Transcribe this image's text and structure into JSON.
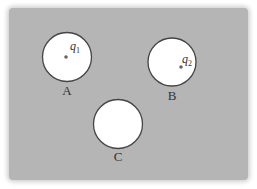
{
  "diagram": {
    "type": "conductor-with-cavities",
    "background_color": "#ffffff",
    "conductor": {
      "color": "#b5b5b5",
      "x": 9,
      "y": 8,
      "width": 239,
      "height": 172
    },
    "cavity_fill": "#ffffff",
    "cavity_stroke": "#444444",
    "charge_color": "#666666",
    "cavities": [
      {
        "label": "A",
        "cx": 67,
        "cy": 57,
        "r": 24.5,
        "label_x": 67,
        "label_y": 95,
        "charge": {
          "symbol": "q",
          "subscript": "1",
          "x": 66,
          "y": 57,
          "text_x": 70,
          "text_y": 50
        }
      },
      {
        "label": "B",
        "cx": 172,
        "cy": 62,
        "r": 24,
        "label_x": 172,
        "label_y": 100,
        "charge": {
          "symbol": "q",
          "subscript": "2",
          "x": 181,
          "y": 67,
          "text_x": 182,
          "text_y": 63
        }
      },
      {
        "label": "C",
        "cx": 118,
        "cy": 124,
        "r": 24.5,
        "label_x": 118,
        "label_y": 161,
        "charge": null
      }
    ]
  }
}
